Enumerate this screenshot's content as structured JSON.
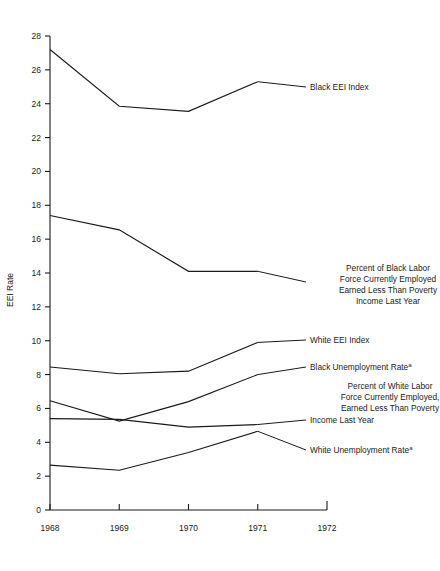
{
  "chart_data": {
    "type": "line",
    "title": "",
    "subtitle": "",
    "xlabel": "",
    "ylabel": "EEI Rate",
    "x": [
      1968,
      1969,
      1970,
      1971
    ],
    "xtick_labels": [
      "1968",
      "1969",
      "1970",
      "1971",
      "1972"
    ],
    "xlim": [
      1968,
      1972
    ],
    "ylim": [
      0,
      28
    ],
    "ytick_labels": [
      "0",
      "2",
      "4",
      "6",
      "8",
      "10",
      "12",
      "14",
      "16",
      "18",
      "20",
      "22",
      "24",
      "26",
      "28"
    ],
    "yticks": [
      0,
      2,
      4,
      6,
      8,
      10,
      12,
      14,
      16,
      18,
      20,
      22,
      24,
      26,
      28
    ],
    "grid": false,
    "legend_position": "right-inline-labels",
    "line_color": "#1a1a1a",
    "background_color": "#ffffff",
    "series": [
      {
        "name": "Black EEI Index",
        "label_lines": [
          "Black EEI Index"
        ],
        "superscript": "",
        "values": [
          27.2,
          23.85,
          23.55,
          25.3
        ]
      },
      {
        "name": "Percent of Black Labor Force Currently Employed Earned Less Than Poverty Income Last Year",
        "label_lines": [
          "Percent of Black Labor",
          "Force Currently Employed",
          "Earned Less Than Poverty",
          "Income Last Year"
        ],
        "superscript": "",
        "values": [
          17.4,
          16.55,
          14.1,
          14.1
        ]
      },
      {
        "name": "White EEI Index",
        "label_lines": [
          "White EEI Index"
        ],
        "superscript": "",
        "values": [
          8.45,
          8.05,
          8.2,
          9.9
        ]
      },
      {
        "name": "Black Unemployment Rate",
        "label_lines": [
          "Black  Unemployment Rate"
        ],
        "superscript": "a",
        "values": [
          6.45,
          5.25,
          6.4,
          8.0
        ]
      },
      {
        "name": "Percent of White Labor Force Currently Employed, Earned Less Than Poverty Income Last Year",
        "label_lines": [
          "Percent of White Labor",
          "Force Currently Employed,",
          "Earned Less Than Poverty",
          "Income Last Year"
        ],
        "superscript": "",
        "values": [
          5.4,
          5.35,
          4.9,
          5.05
        ]
      },
      {
        "name": "White Unemployment Rate",
        "label_lines": [
          "White Unemployment Rate"
        ],
        "superscript": "a",
        "values": [
          2.65,
          2.35,
          3.4,
          4.65
        ]
      }
    ]
  },
  "axis": {
    "y_title": "EEI Rate"
  },
  "labels": {
    "black_eei_index": "Black EEI Index",
    "black_poverty_l1": "Percent of Black Labor",
    "black_poverty_l2": "Force Currently Employed",
    "black_poverty_l3": "Earned Less Than Poverty",
    "black_poverty_l4": "Income Last Year",
    "white_eei_index": "White EEI Index",
    "black_unemployment": "Black  Unemployment Rate",
    "black_unemployment_sup": "a",
    "white_poverty_l1": "Percent of White Labor",
    "white_poverty_l2": "Force Currently Employed,",
    "white_poverty_l3": "Earned Less Than Poverty",
    "white_poverty_l4": "Income Last Year",
    "white_unemployment": "White Unemployment Rate",
    "white_unemployment_sup": "a"
  },
  "ticks": {
    "y": [
      "28",
      "26",
      "24",
      "22",
      "20",
      "18",
      "16",
      "14",
      "12",
      "10",
      "8",
      "6",
      "4",
      "2",
      "0"
    ],
    "x": [
      "1968",
      "1969",
      "1970",
      "1971",
      "1972"
    ]
  }
}
